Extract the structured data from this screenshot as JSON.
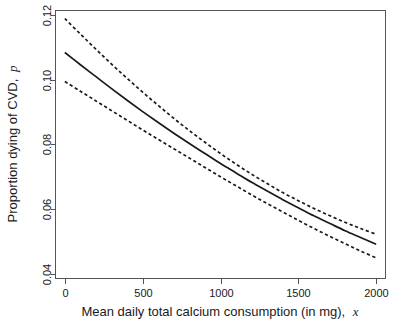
{
  "chart_data": {
    "type": "line",
    "title": "",
    "subtitle": "",
    "xlabel": "Mean daily total calcium consumption (in mg), x",
    "xlabel_plain": "Mean daily total calcium consumption (in mg),",
    "xlabel_italic_symbol": "x",
    "ylabel": "Proportion dying of CVD, p",
    "ylabel_plain": "Proportion dying of CVD,",
    "ylabel_italic_symbol": "p",
    "xlim": [
      -60,
      2060
    ],
    "ylim": [
      0.0385,
      0.1215
    ],
    "xticks": [
      0,
      500,
      1000,
      1500,
      2000
    ],
    "xtick_labels": [
      "0",
      "500",
      "1000",
      "1500",
      "2000"
    ],
    "yticks": [
      0.04,
      0.06,
      0.08,
      0.1,
      0.12
    ],
    "ytick_labels": [
      "0.04",
      "0.06",
      "0.08",
      "0.10",
      "0.12"
    ],
    "grid": false,
    "legend": false,
    "legend_position": "none",
    "box_frame": true,
    "x": [
      0,
      100,
      200,
      300,
      400,
      500,
      600,
      700,
      800,
      900,
      1000,
      1100,
      1200,
      1300,
      1400,
      1500,
      1600,
      1700,
      1800,
      1900,
      2000
    ],
    "series": [
      {
        "name": "Fitted proportion",
        "style": "solid",
        "color": "#1a1a1a",
        "values": [
          0.1085,
          0.1047,
          0.101,
          0.0973,
          0.0937,
          0.0902,
          0.0868,
          0.0835,
          0.0803,
          0.0772,
          0.0741,
          0.0712,
          0.0683,
          0.0656,
          0.0629,
          0.0604,
          0.0579,
          0.0556,
          0.0533,
          0.0512,
          0.0491
        ],
        "values_note": "logistic fit"
      },
      {
        "name": "Upper 95% confidence band",
        "style": "dashed",
        "color": "#1a1a1a",
        "values": [
          0.119,
          0.1142,
          0.1095,
          0.1049,
          0.1005,
          0.0962,
          0.0921,
          0.0881,
          0.0843,
          0.0807,
          0.0772,
          0.0739,
          0.0708,
          0.0679,
          0.0651,
          0.0626,
          0.0602,
          0.058,
          0.0559,
          0.054,
          0.0522
        ]
      },
      {
        "name": "Lower 95% confidence band",
        "style": "dashed",
        "color": "#1a1a1a",
        "values": [
          0.0995,
          0.0965,
          0.0935,
          0.0905,
          0.0875,
          0.0845,
          0.0816,
          0.0787,
          0.0758,
          0.0729,
          0.07,
          0.0672,
          0.0644,
          0.0617,
          0.0591,
          0.0565,
          0.054,
          0.0516,
          0.0493,
          0.047,
          0.0449
        ]
      }
    ],
    "annotations": []
  },
  "axes": {
    "x_axis_name": "x-axis",
    "y_axis_name": "y-axis"
  }
}
